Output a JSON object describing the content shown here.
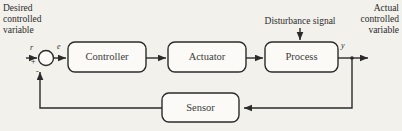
{
  "figure": {
    "kind": "control-system-block-diagram",
    "background_color": "#f2f1ec",
    "line_color": "#2b2b2b"
  },
  "annotations": {
    "desired_variable": "Desired\ncontrolled\nvariable",
    "actual_variable": "Actual\ncontrolled\nvariable",
    "disturbance": "Disturbance signal"
  },
  "blocks": [
    {
      "id": "controller",
      "label": "Controller"
    },
    {
      "id": "actuator",
      "label": "Actuator"
    },
    {
      "id": "process",
      "label": "Process"
    },
    {
      "id": "sensor",
      "label": "Sensor"
    }
  ],
  "signals": {
    "reference": "r",
    "error": "e",
    "output": "y"
  },
  "summing_junction": {
    "positive_sign": "+",
    "negative_sign": "-"
  }
}
